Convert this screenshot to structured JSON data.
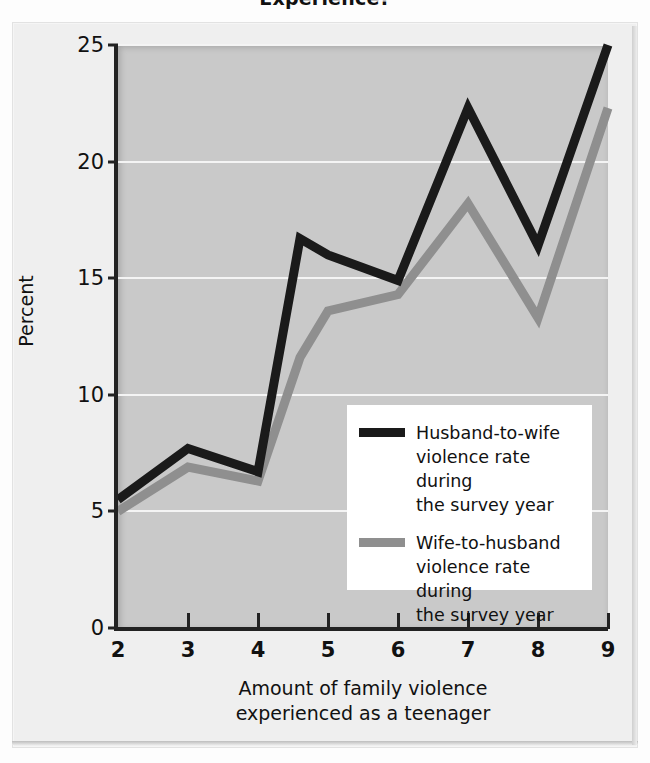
{
  "title": "Experience?",
  "axes": {
    "y_label": "Percent",
    "y_ticks": [
      "0",
      "5",
      "10",
      "15",
      "20",
      "25"
    ],
    "x_label_line1": "Amount of family violence",
    "x_label_line2": "experienced as a teenager",
    "x_ticks": [
      "2",
      "3",
      "4",
      "5",
      "6",
      "7",
      "8",
      "9"
    ]
  },
  "legend": {
    "items": [
      {
        "name": "husband-to-wife",
        "color": "#1a1a1a",
        "line1": "Husband-to-wife",
        "line2": "violence rate during",
        "line3": "the survey year"
      },
      {
        "name": "wife-to-husband",
        "color": "#8f8f8f",
        "line1": "Wife-to-husband",
        "line2": "violence rate during",
        "line3": "the survey year"
      }
    ]
  },
  "colors": {
    "plot_background": "#c9c9c9",
    "panel_background": "#efefef",
    "gridline": "#f4f4f4",
    "axis": "#222222",
    "husband_line": "#1a1a1a",
    "wife_line": "#8f8f8f"
  },
  "chart_data": {
    "type": "line",
    "title": "Experience?",
    "xlabel": "Amount of family violence experienced as a teenager",
    "ylabel": "Percent",
    "xlim": [
      2,
      9
    ],
    "ylim": [
      0,
      25
    ],
    "yticks": [
      0,
      5,
      10,
      15,
      20,
      25
    ],
    "xticks": [
      2,
      3,
      4,
      5,
      6,
      7,
      8,
      9
    ],
    "grid": "horizontal",
    "legend_position": "center-right",
    "series": [
      {
        "name": "Husband-to-wife violence rate during the survey year",
        "color": "#1a1a1a",
        "x": [
          2,
          3,
          4,
          4.6,
          5,
          6,
          7,
          8,
          9
        ],
        "values": [
          5.5,
          7.7,
          6.7,
          16.7,
          16.0,
          14.9,
          22.3,
          16.4,
          25.0
        ]
      },
      {
        "name": "Wife-to-husband violence rate during the survey year",
        "color": "#8f8f8f",
        "x": [
          2,
          3,
          4,
          4.6,
          5,
          6,
          7,
          8,
          9
        ],
        "values": [
          5.0,
          6.9,
          6.3,
          11.6,
          13.6,
          14.3,
          18.2,
          13.3,
          22.3
        ]
      }
    ]
  }
}
